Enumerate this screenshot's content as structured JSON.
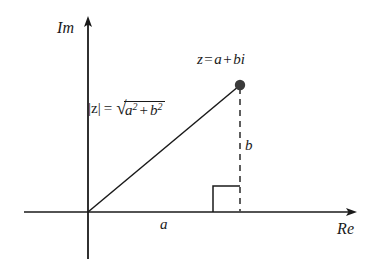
{
  "diagram": {
    "background_color": "#ffffff",
    "stroke_color": "#1a1a1a",
    "dashed_color": "#4d4d4d",
    "axes": {
      "imaginary_label": "Im",
      "real_label": "Re",
      "origin": {
        "x": 88,
        "y": 212
      },
      "imaginary_axis": {
        "x": 88,
        "y_top": 18,
        "y_bottom": 259
      },
      "real_axis": {
        "y": 212,
        "x_left": 24,
        "x_right": 355
      }
    },
    "point": {
      "label_parts": {
        "z": "z",
        "equals": "=",
        "a": "a",
        "plus": "+",
        "bi": "bi"
      },
      "label_full": "z = a + bi",
      "x": 240,
      "y": 85,
      "radius": 5,
      "fill": "#3b3b3b"
    },
    "magnitude": {
      "modulus_bars": "|z|",
      "equals": "=",
      "surd": "√",
      "a_base": "a",
      "a_exponent": "2",
      "plus": "+",
      "b_base": "b",
      "b_exponent": "2",
      "full_text": "|z| = √(a² + b²)"
    },
    "legs": {
      "horizontal_label": "a",
      "vertical_label": "b"
    },
    "right_angle_marker": {
      "x": 213,
      "y": 185,
      "size": 27
    }
  }
}
